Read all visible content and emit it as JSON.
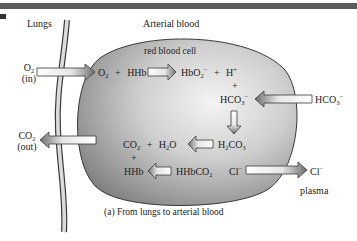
{
  "header": {
    "lungs_label": "Lungs",
    "region_label": "Arterial blood"
  },
  "cell": {
    "label": "red blood cell"
  },
  "outside": {
    "o2_in": {
      "species": "O",
      "sub": "2",
      "note": "(in)"
    },
    "co2_out": {
      "species": "CO",
      "sub": "2",
      "note": "(out)"
    },
    "hco3_plasma": {
      "species": "HCO",
      "sub": "3",
      "sup": "−"
    },
    "cl_plasma": {
      "species": "Cl",
      "sup": "−"
    },
    "plasma_label": "plasma"
  },
  "reactions": {
    "row1": {
      "o2": "O",
      "o2_sub": "2",
      "plus1": "+",
      "hhb": "HHb",
      "hbo2": "HbO",
      "hbo2_sub": "2",
      "hbo2_sup": "−",
      "plus2": "+",
      "h": "H",
      "h_sup": "+"
    },
    "plus_mid": "+",
    "hco3": {
      "species": "HCO",
      "sub": "3",
      "sup": "−"
    },
    "row3": {
      "co2": "CO",
      "co2_sub": "2",
      "plus": "+",
      "h2o_a": "H",
      "h2o_sub": "2",
      "h2o_b": "O",
      "h2co3_a": "H",
      "h2co3_sub1": "2",
      "h2co3_b": "CO",
      "h2co3_sub2": "3"
    },
    "plus_low": "+",
    "row4": {
      "hhb": "HHb",
      "hhbco2": "HHbCO",
      "hhbco2_sub": "2",
      "cl": "Cl",
      "cl_sup": "−"
    }
  },
  "caption": "(a) From lungs to arterial blood",
  "colors": {
    "bar": "#5a5a5a",
    "cell_dark": "#8a8a8a",
    "cell_light": "#f2f2f2",
    "outline": "#3a3a3a",
    "arrow_fill_light": "#ffffff",
    "arrow_fill_dark": "#7a7a7a"
  }
}
